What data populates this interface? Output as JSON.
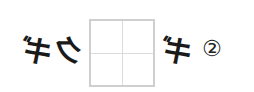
{
  "question": {
    "left_chars": [
      "ギ",
      "ク"
    ],
    "right_chars": [
      "ギ"
    ],
    "mirrored": true,
    "answer_box": {
      "empty": true
    },
    "item_number": "②"
  },
  "colors": {
    "text": "#1a1a1a",
    "box_border": "#cfcfcf",
    "box_guides": "#dcdcdc"
  }
}
